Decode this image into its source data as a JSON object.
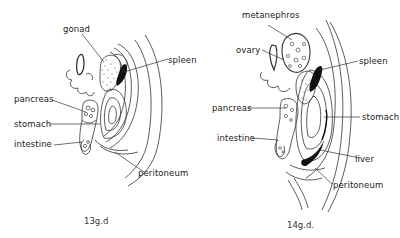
{
  "figures": [
    {
      "id": "13gd",
      "caption": "13g.d",
      "labels": {
        "gonad": "gonad",
        "spleen": "spleen",
        "pancreas": "pancreas",
        "stomach": "stomach",
        "intestine": "intestine",
        "peritoneum": "peritoneum"
      }
    },
    {
      "id": "14gd",
      "caption": "14g.d.",
      "labels": {
        "metanephros": "metanephros",
        "ovary": "ovary",
        "spleen": "spleen",
        "pancreas": "pancreas",
        "stomach": "stomach",
        "intestine": "intestine",
        "liver": "liver",
        "peritoneum": "peritoneum"
      }
    }
  ],
  "colors": {
    "ink": "#222222",
    "background": "#ffffff"
  }
}
